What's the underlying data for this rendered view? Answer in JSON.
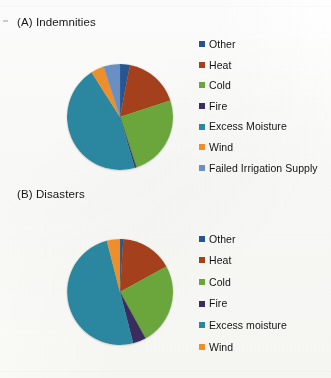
{
  "figure": {
    "background_color": "#fdfdfb",
    "panels": [
      {
        "id": "a",
        "title": "(A) Indemnities"
      },
      {
        "id": "b",
        "title": "(B) Disasters"
      }
    ]
  },
  "chart_data": [
    {
      "type": "pie",
      "title": "(A) Indemnities",
      "xlabel": "",
      "ylabel": "",
      "legend_position": "right",
      "grid": false,
      "start_angle_deg": 0,
      "direction": "clockwise",
      "categories": [
        "Other",
        "Heat",
        "Cold",
        "Fire",
        "Excess Moisture",
        "Wind",
        "Failed Irrigation Supply"
      ],
      "values": [
        3,
        17,
        25,
        0.5,
        45.5,
        4,
        5
      ],
      "units": "percent",
      "colors": [
        "#27568f",
        "#a4401c",
        "#6aa63c",
        "#3a2d5e",
        "#2b87a0",
        "#ee8f2b",
        "#6a8fc4"
      ],
      "legend": [
        {
          "label": "Other",
          "color": "#27568f"
        },
        {
          "label": "Heat",
          "color": "#a4401c"
        },
        {
          "label": "Cold",
          "color": "#6aa63c"
        },
        {
          "label": "Fire",
          "color": "#3a2d5e"
        },
        {
          "label": "Excess Moisture",
          "color": "#2b87a0"
        },
        {
          "label": "Wind",
          "color": "#ee8f2b"
        },
        {
          "label": "Failed Irrigation Supply",
          "color": "#6a8fc4"
        }
      ]
    },
    {
      "type": "pie",
      "title": "(B) Disasters",
      "xlabel": "",
      "ylabel": "",
      "legend_position": "right",
      "grid": false,
      "start_angle_deg": 0,
      "direction": "clockwise",
      "categories": [
        "Other",
        "Heat",
        "Cold",
        "Fire",
        "Excess moisture",
        "Wind"
      ],
      "values": [
        1,
        16,
        25,
        4,
        50,
        4
      ],
      "units": "percent",
      "colors": [
        "#27568f",
        "#a4401c",
        "#6aa63c",
        "#3a2d5e",
        "#2b87a0",
        "#ee8f2b"
      ],
      "legend": [
        {
          "label": "Other",
          "color": "#27568f"
        },
        {
          "label": "Heat",
          "color": "#a4401c"
        },
        {
          "label": "Cold",
          "color": "#6aa63c"
        },
        {
          "label": "Fire",
          "color": "#3a2d5e"
        },
        {
          "label": "Excess moisture",
          "color": "#2b87a0"
        },
        {
          "label": "Wind",
          "color": "#ee8f2b"
        }
      ]
    }
  ]
}
